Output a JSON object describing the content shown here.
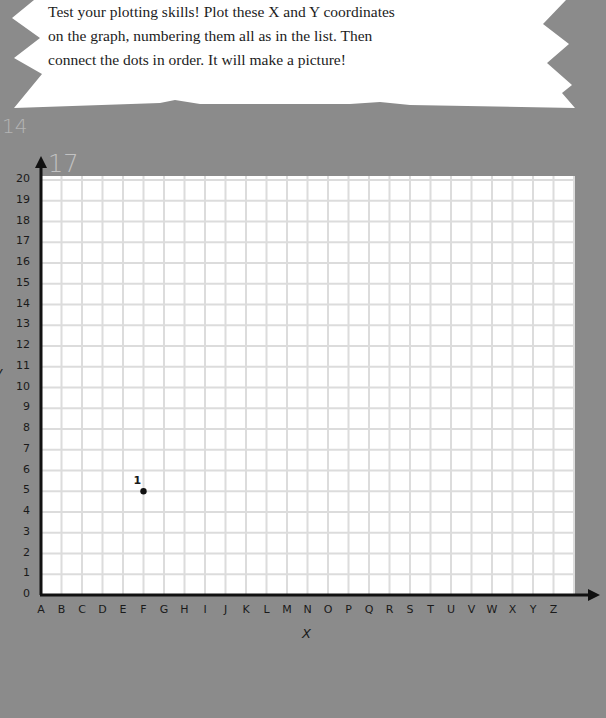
{
  "instructions": {
    "lines": [
      "Test your plotting skills! Plot these X and Y coordinates",
      "on the graph, numbering them all as in the list. Then",
      "connect the dots in order. It will make a picture!"
    ]
  },
  "background": {
    "page_numbers_partial": [
      "14",
      "17"
    ]
  },
  "colors": {
    "background": "#8b8b8b",
    "paper": "#ffffff",
    "grid_line": "#dcdcdc",
    "axis": "#111111"
  },
  "chart_data": {
    "type": "scatter",
    "title": "",
    "xlabel": "X",
    "ylabel": "y",
    "x_categories": [
      "A",
      "B",
      "C",
      "D",
      "E",
      "F",
      "G",
      "H",
      "I",
      "J",
      "K",
      "L",
      "M",
      "N",
      "O",
      "P",
      "Q",
      "R",
      "S",
      "T",
      "U",
      "V",
      "W",
      "X",
      "Y",
      "Z"
    ],
    "y_ticks": [
      0,
      1,
      2,
      3,
      4,
      5,
      6,
      7,
      8,
      9,
      10,
      11,
      12,
      13,
      14,
      15,
      16,
      17,
      18,
      19,
      20
    ],
    "ylim": [
      0,
      20
    ],
    "grid": true,
    "points": [
      {
        "label": "1",
        "x": "F",
        "y": 5
      }
    ]
  }
}
